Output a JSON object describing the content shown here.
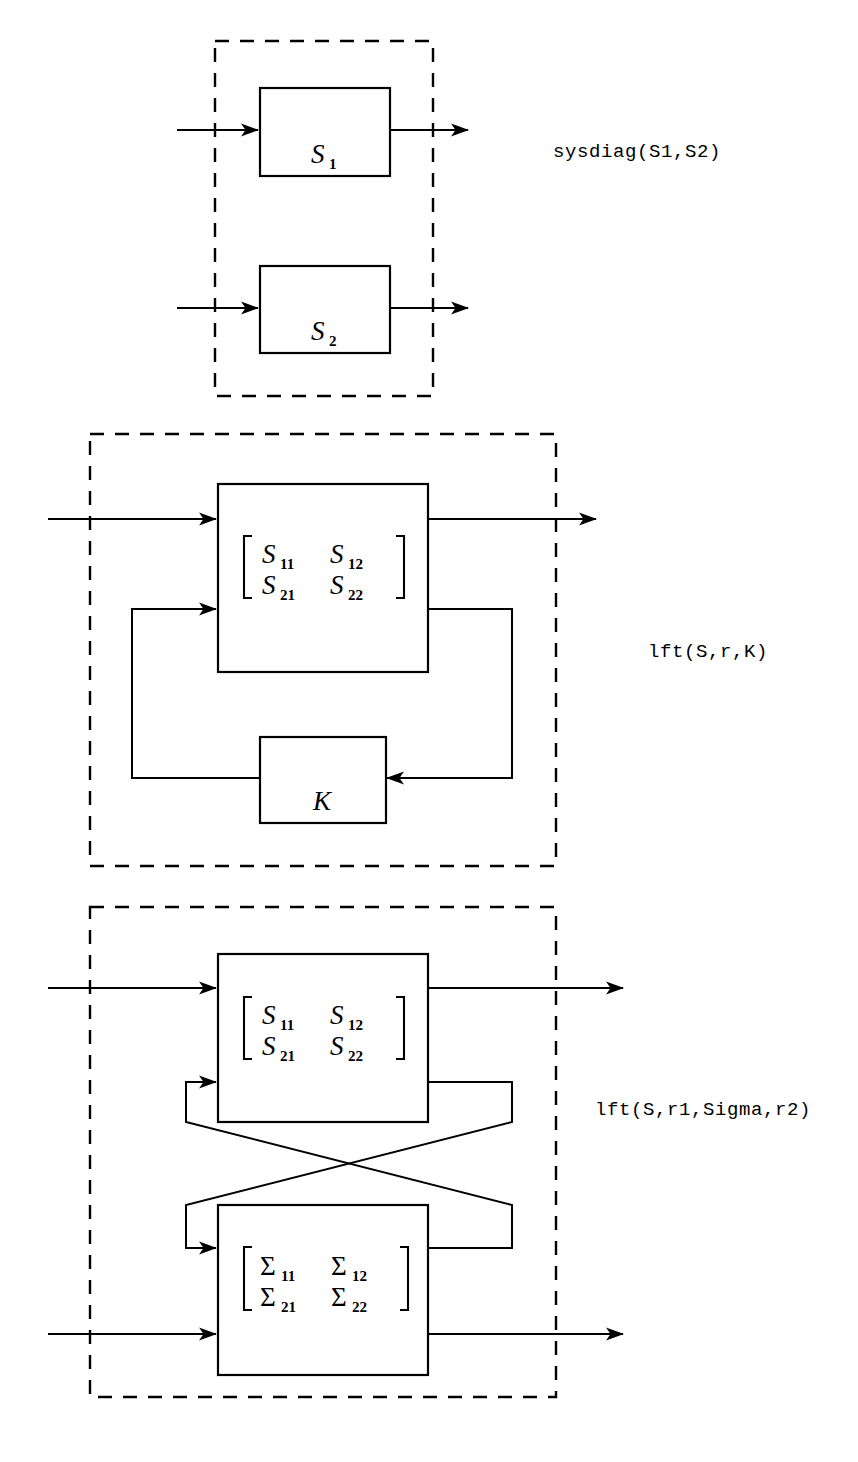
{
  "page": {
    "background": "#ffffff",
    "ink": "#000000",
    "width": 858,
    "height": 1462
  },
  "diagrams": [
    {
      "id": "sysdiag",
      "label": "sysdiag(S1,S2)",
      "blocks": [
        {
          "name": "S1",
          "base": "S",
          "sub": "1"
        },
        {
          "name": "S2",
          "base": "S",
          "sub": "2"
        }
      ],
      "description": "Two independent blocks S1 and S2 stacked inside a dashed boundary, each with one input arrow and one output arrow."
    },
    {
      "id": "lft-single",
      "label": "lft(S,r,K)",
      "blocks": [
        {
          "name": "S",
          "matrix": [
            [
              "S11",
              "S12"
            ],
            [
              "S21",
              "S22"
            ]
          ],
          "entries": [
            {
              "base": "S",
              "sub": "11"
            },
            {
              "base": "S",
              "sub": "12"
            },
            {
              "base": "S",
              "sub": "21"
            },
            {
              "base": "S",
              "sub": "22"
            }
          ]
        },
        {
          "name": "K",
          "base": "K",
          "sub": ""
        }
      ],
      "description": "Block S with 2x2 transfer matrix in feedback with block K; the second output of S feeds K and K feeds back to the second input of S."
    },
    {
      "id": "lft-double",
      "label": "lft(S,r1,Sigma,r2)",
      "blocks": [
        {
          "name": "S",
          "matrix": [
            [
              "S11",
              "S12"
            ],
            [
              "S21",
              "S22"
            ]
          ],
          "entries": [
            {
              "base": "S",
              "sub": "11"
            },
            {
              "base": "S",
              "sub": "12"
            },
            {
              "base": "S",
              "sub": "21"
            },
            {
              "base": "S",
              "sub": "22"
            }
          ]
        },
        {
          "name": "Sigma",
          "matrix": [
            [
              "Sigma11",
              "Sigma12"
            ],
            [
              "Sigma21",
              "Sigma22"
            ]
          ],
          "entries": [
            {
              "base": "Σ",
              "sub": "11"
            },
            {
              "base": "Σ",
              "sub": "12"
            },
            {
              "base": "Σ",
              "sub": "21"
            },
            {
              "base": "Σ",
              "sub": "22"
            }
          ]
        }
      ],
      "description": "Blocks S and Sigma cross-connected: second output of S goes to second input of Sigma and second output of Sigma goes to second input of S, lines crossing in the middle."
    }
  ],
  "icons": {
    "arrow": "arrowhead-right",
    "arrow_left": "arrowhead-left"
  }
}
